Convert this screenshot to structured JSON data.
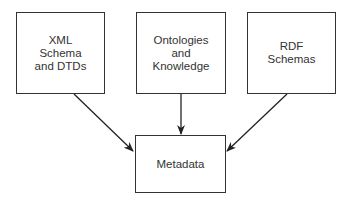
{
  "diagram": {
    "sources": [
      {
        "id": "xml",
        "lines": [
          "XML",
          "Schema",
          "and DTDs"
        ]
      },
      {
        "id": "ontologies",
        "lines": [
          "Ontologies",
          "and",
          "Knowledge"
        ]
      },
      {
        "id": "rdf",
        "lines": [
          "RDF",
          "Schemas"
        ]
      }
    ],
    "target": {
      "id": "metadata",
      "label": "Metadata"
    },
    "edges": [
      {
        "from": "xml",
        "to": "metadata"
      },
      {
        "from": "ontologies",
        "to": "metadata"
      },
      {
        "from": "rdf",
        "to": "metadata"
      }
    ]
  }
}
